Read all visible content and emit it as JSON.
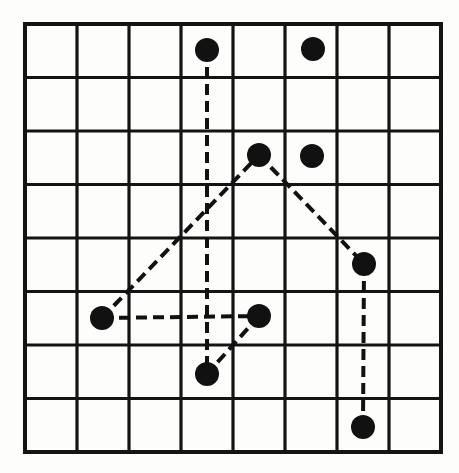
{
  "figure": {
    "title": "Dot pattern on 8 by 8 square lattice with dashed connecting path",
    "background_color": "#fdfdfc",
    "ink_color": "#111111"
  },
  "grid": {
    "name": "square-lattice",
    "columns": 8,
    "rows": 8,
    "origin_x": 25,
    "origin_y": 24,
    "cell_width": 52,
    "cell_height": 53.5,
    "line_color": "#141414",
    "line_width": 3.2,
    "border_width": 4.0
  },
  "chart_data": {
    "type": "scatter",
    "title": "Dot pattern on 8 by 8 square lattice with dashed connecting path",
    "xlabel": "",
    "ylabel": "",
    "xlim": [
      0,
      8
    ],
    "ylim": [
      0,
      8
    ],
    "grid": true,
    "legend": "none",
    "marker": "filled-circle",
    "marker_radius_px": 12,
    "marker_color": "#111111",
    "points": [
      {
        "id": "p1",
        "label": "top-left-dot",
        "col": 3.5,
        "row": 0.5,
        "x_px": 207,
        "y_px": 50
      },
      {
        "id": "p2",
        "label": "top-right-dot",
        "col": 5.5,
        "row": 0.5,
        "x_px": 313,
        "y_px": 49
      },
      {
        "id": "p3",
        "label": "peak-dot",
        "col": 4.5,
        "row": 2.5,
        "x_px": 259,
        "y_px": 155
      },
      {
        "id": "p4",
        "label": "isolated-upper-dot",
        "col": 5.5,
        "row": 2.5,
        "x_px": 312,
        "y_px": 156
      },
      {
        "id": "p5",
        "label": "right-mid-dot",
        "col": 6.5,
        "row": 4.5,
        "x_px": 364,
        "y_px": 264
      },
      {
        "id": "p6",
        "label": "left-dot",
        "col": 1.5,
        "row": 5.5,
        "x_px": 102,
        "y_px": 318
      },
      {
        "id": "p7",
        "label": "center-dot",
        "col": 4.5,
        "row": 5.5,
        "x_px": 259,
        "y_px": 316
      },
      {
        "id": "p8",
        "label": "lower-center-dot",
        "col": 3.5,
        "row": 6.5,
        "x_px": 207,
        "y_px": 374
      },
      {
        "id": "p9",
        "label": "bottom-right-dot",
        "col": 6.5,
        "row": 7.5,
        "x_px": 363,
        "y_px": 427
      }
    ],
    "connections": [
      {
        "id": "c1",
        "label": "vertical-top-to-lower-center",
        "from": "p1",
        "to": "p8",
        "style": "dashed"
      },
      {
        "id": "c2",
        "label": "diagonal-left-to-peak",
        "from": "p6",
        "to": "p3",
        "style": "dashed"
      },
      {
        "id": "c3",
        "label": "diagonal-peak-to-right-mid",
        "from": "p3",
        "to": "p5",
        "style": "dashed"
      },
      {
        "id": "c4",
        "label": "vertical-right-mid-to-bottom",
        "from": "p5",
        "to": "p9",
        "style": "dashed"
      },
      {
        "id": "c5",
        "label": "horizontal-left-to-center",
        "from": "p6",
        "to": "p7",
        "style": "dashed"
      },
      {
        "id": "c6",
        "label": "diagonal-center-to-lower",
        "from": "p7",
        "to": "p8",
        "style": "dashed"
      }
    ],
    "line_style": {
      "dash_on_px": 11,
      "dash_off_px": 6,
      "width_px": 4,
      "color": "#111111"
    }
  }
}
